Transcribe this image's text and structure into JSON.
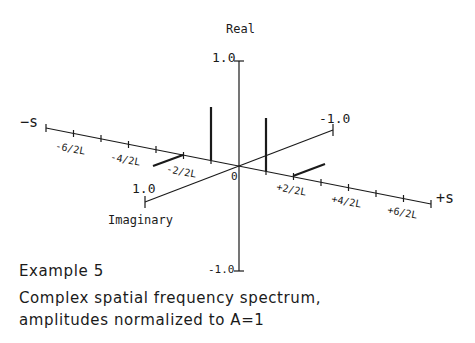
{
  "diagram": {
    "axes": {
      "real_label": "Real",
      "imaginary_label": "Imaginary",
      "real_top": "1.0",
      "real_bottom": "-1.0",
      "imag_far": "-1.0",
      "imag_near": "1.0",
      "s_minus": "−s",
      "s_plus": "+s",
      "origin": "0"
    },
    "s_ticks": {
      "neg6": "-6/2L",
      "neg4": "-4/2L",
      "neg2": "-2/2L",
      "pos2": "+2/2L",
      "pos4": "+4/2L",
      "pos6": "+6/2L"
    },
    "components": [
      {
        "s": "-2/2L",
        "part": "imaginary",
        "direction": "toward +1.0"
      },
      {
        "s": "-1/2L",
        "part": "real",
        "amplitude": 0.5
      },
      {
        "s": "+1/2L",
        "part": "real",
        "amplitude": 0.5
      },
      {
        "s": "+2/2L",
        "part": "imaginary",
        "direction": "toward -1.0"
      }
    ]
  },
  "caption": {
    "title": "Example 5",
    "line1": "Complex spatial frequency spectrum,",
    "line2": "amplitudes normalized to A=1"
  }
}
